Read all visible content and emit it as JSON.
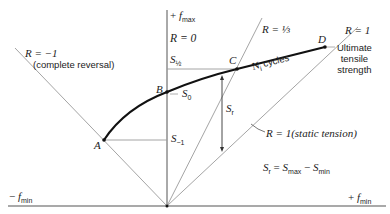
{
  "diagram": {
    "axes": {
      "vertical_label_sign": "+",
      "vertical_label": "f",
      "vertical_label_sub": "max",
      "horizontal_left_sign": "−",
      "horizontal_left_label": "f",
      "horizontal_left_sub": "min",
      "horizontal_right_sign": "+",
      "horizontal_right_label": "f",
      "horizontal_right_sub": "min"
    },
    "rays": {
      "r_minus_one": "R = −1",
      "r_minus_one_note": "(complete reversal)",
      "r_zero": "R = 0",
      "r_third": "R = ⅓",
      "r_one": "R = 1",
      "r_one_static": "R = 1(static tension)"
    },
    "points": {
      "a": "A",
      "b": "B",
      "c": "C",
      "d": "D"
    },
    "stress_labels": {
      "s_half": "S",
      "s_half_sub": "½",
      "s_zero": "S",
      "s_zero_sub": "0",
      "s_minus_one": "S",
      "s_minus_one_sub": "−1",
      "s_r": "S",
      "s_r_sub": "r"
    },
    "curve_label": "N",
    "curve_label_sub": "i",
    "curve_label_suffix": " cycles",
    "ultimate": {
      "line1": "Ultimate",
      "line2": "tensile",
      "line3": "strength"
    },
    "formula": {
      "lhs": "S",
      "lhs_sub": "r",
      "eq": " = ",
      "t1": "S",
      "t1_sub": "max",
      "minus": " − ",
      "t2": "S",
      "t2_sub": "min"
    },
    "colors": {
      "thin_line": "#8a8a8a",
      "axis": "#555555",
      "curve": "#111111",
      "text": "#222222"
    }
  }
}
